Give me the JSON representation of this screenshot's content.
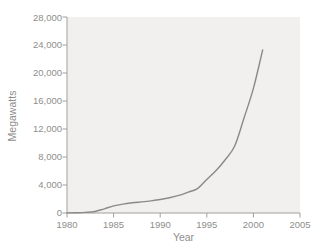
{
  "figure": {
    "background": "#ffffff",
    "plot_background": "#f1f0ee",
    "axis_color": "#a0a09e",
    "text_color": "#8e8e8c",
    "line_color": "#8a8a8a"
  },
  "chart_data": {
    "type": "line",
    "title": "",
    "xlabel": "Year",
    "ylabel": "Megawatts",
    "xlim": [
      1980,
      2005
    ],
    "ylim": [
      0,
      28000
    ],
    "grid": false,
    "legend": null,
    "xticks": [
      1980,
      1985,
      1990,
      1995,
      2000,
      2005
    ],
    "xtick_labels": [
      "1980",
      "1985",
      "1990",
      "1995",
      "2000",
      "2005"
    ],
    "yticks": [
      0,
      4000,
      8000,
      12000,
      16000,
      20000,
      24000,
      28000
    ],
    "ytick_labels": [
      "0",
      "4,000",
      "8,000",
      "12,000",
      "16,000",
      "20,000",
      "24,000",
      "28,000"
    ],
    "series": [
      {
        "name": "Worldwide wind energy generating capacity",
        "x": [
          1980,
          1981,
          1982,
          1983,
          1984,
          1985,
          1986,
          1987,
          1988,
          1989,
          1990,
          1991,
          1992,
          1993,
          1994,
          1995,
          1996,
          1997,
          1998,
          1999,
          2000,
          2001
        ],
        "values": [
          10,
          25,
          90,
          210,
          600,
          1020,
          1270,
          1450,
          1580,
          1730,
          1930,
          2170,
          2510,
          2990,
          3490,
          4780,
          6070,
          7640,
          9600,
          13600,
          17800,
          23300
        ]
      }
    ]
  }
}
